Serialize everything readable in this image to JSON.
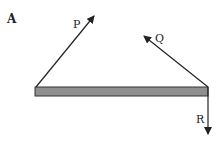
{
  "panel_label": "A",
  "forces": {
    "P": {
      "label": "P"
    },
    "Q": {
      "label": "Q"
    },
    "R": {
      "label": "R"
    }
  },
  "beam": {
    "fill": "#8f8f8f",
    "stroke": "#333333"
  },
  "colors": {
    "arrow": "#222222"
  }
}
